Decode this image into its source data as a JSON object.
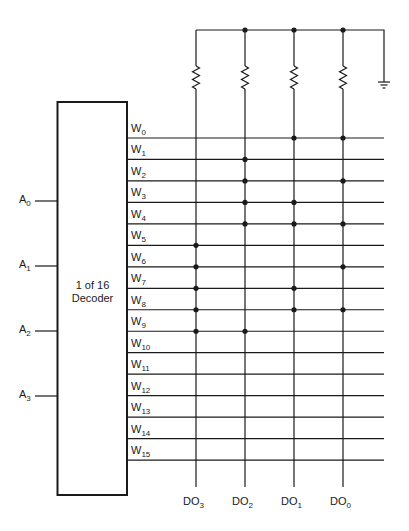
{
  "decoder": {
    "line1": "1 of 16",
    "line2": "Decoder"
  },
  "address_inputs": [
    {
      "name": "A",
      "sub": "0",
      "y": 201
    },
    {
      "name": "A",
      "sub": "1",
      "y": 266
    },
    {
      "name": "A",
      "sub": "2",
      "y": 331
    },
    {
      "name": "A",
      "sub": "3",
      "y": 396
    }
  ],
  "word_lines": [
    {
      "name": "W",
      "sub": "0"
    },
    {
      "name": "W",
      "sub": "1"
    },
    {
      "name": "W",
      "sub": "2"
    },
    {
      "name": "W",
      "sub": "3"
    },
    {
      "name": "W",
      "sub": "4"
    },
    {
      "name": "W",
      "sub": "5"
    },
    {
      "name": "W",
      "sub": "6"
    },
    {
      "name": "W",
      "sub": "7"
    },
    {
      "name": "W",
      "sub": "8"
    },
    {
      "name": "W",
      "sub": "9"
    },
    {
      "name": "W",
      "sub": "10"
    },
    {
      "name": "W",
      "sub": "11"
    },
    {
      "name": "W",
      "sub": "12"
    },
    {
      "name": "W",
      "sub": "13"
    },
    {
      "name": "W",
      "sub": "14"
    },
    {
      "name": "W",
      "sub": "15"
    }
  ],
  "data_outputs": [
    {
      "name": "DO",
      "sub": "3",
      "x": 196
    },
    {
      "name": "DO",
      "sub": "2",
      "x": 245
    },
    {
      "name": "DO",
      "sub": "1",
      "x": 294
    },
    {
      "name": "DO",
      "sub": "0",
      "x": 343
    }
  ],
  "connections_note": "Each word row lists output columns with a diode/junction dot",
  "connections": [
    {
      "word": 0,
      "outputs": [
        "DO1",
        "DO0"
      ]
    },
    {
      "word": 1,
      "outputs": [
        "DO2"
      ]
    },
    {
      "word": 2,
      "outputs": [
        "DO2",
        "DO0"
      ]
    },
    {
      "word": 3,
      "outputs": [
        "DO2",
        "DO1"
      ]
    },
    {
      "word": 4,
      "outputs": [
        "DO2",
        "DO1",
        "DO0"
      ]
    },
    {
      "word": 5,
      "outputs": [
        "DO3"
      ]
    },
    {
      "word": 6,
      "outputs": [
        "DO3",
        "DO0"
      ]
    },
    {
      "word": 7,
      "outputs": [
        "DO3",
        "DO1"
      ]
    },
    {
      "word": 8,
      "outputs": [
        "DO3",
        "DO1",
        "DO0"
      ]
    },
    {
      "word": 9,
      "outputs": [
        "DO3",
        "DO2"
      ]
    },
    {
      "word": 10,
      "outputs": []
    },
    {
      "word": 11,
      "outputs": []
    },
    {
      "word": 12,
      "outputs": []
    },
    {
      "word": 13,
      "outputs": []
    },
    {
      "word": 14,
      "outputs": []
    },
    {
      "word": 15,
      "outputs": []
    }
  ],
  "components": {
    "pull_resistors": 4,
    "ground_symbol": "ground-icon"
  },
  "colors": {
    "line": "#1a1a1a",
    "background": "#ffffff"
  }
}
